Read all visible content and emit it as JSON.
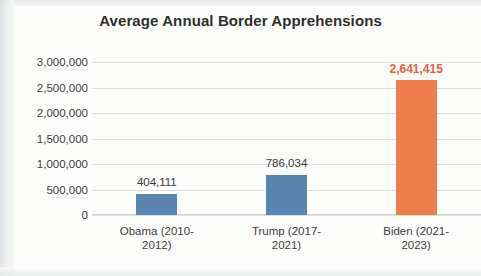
{
  "chart_data": {
    "type": "bar",
    "title": "Average Annual Border Apprehensions",
    "xlabel": "",
    "ylabel": "",
    "categories": [
      "Obama (2010-2012)",
      "Trump (2017-2021)",
      "Biden (2021-2023)"
    ],
    "category_lines": [
      [
        "Obama (2010-",
        "2012)"
      ],
      [
        "Trump (2017-",
        "2021)"
      ],
      [
        "Biden (2021-",
        "2023)"
      ]
    ],
    "values": [
      404111,
      786034,
      2641415
    ],
    "value_labels": [
      "404,111",
      "786,034",
      "2,641,415"
    ],
    "bar_colors": [
      "#5b84b1",
      "#5b84b1",
      "#ed7d4b"
    ],
    "label_colors": [
      "#3a3a3a",
      "#3a3a3a",
      "#e8603c"
    ],
    "highlight_index": 2,
    "ylim": [
      0,
      3000000
    ],
    "ytick_values": [
      3000000,
      2500000,
      2000000,
      1500000,
      1000000,
      500000,
      0
    ],
    "ytick_labels": [
      "3,000,000",
      "2,500,000",
      "2,000,000",
      "1,500,000",
      "1,000,000",
      "500,000",
      "0"
    ],
    "grid": true,
    "legend": false,
    "legend_position": "none"
  }
}
